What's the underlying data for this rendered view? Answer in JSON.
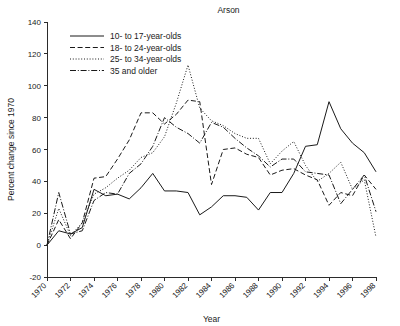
{
  "chart_data": {
    "type": "line",
    "title": "Arson",
    "xlabel": "Year",
    "ylabel": "Percent change since 1970",
    "xlim": [
      1970,
      1998
    ],
    "ylim": [
      -20,
      140
    ],
    "ytick_values": [
      -20,
      0,
      20,
      40,
      60,
      80,
      100,
      120,
      140
    ],
    "ytick_labels": [
      "-20",
      "0",
      "20",
      "40",
      "60",
      "80",
      "100",
      "120",
      "140"
    ],
    "xtick_values": [
      1970,
      1972,
      1974,
      1976,
      1978,
      1980,
      1982,
      1984,
      1986,
      1988,
      1990,
      1992,
      1994,
      1996,
      1998
    ],
    "xtick_labels": [
      "1970",
      "1972",
      "1974",
      "1976",
      "1978",
      "1980",
      "1982",
      "1984",
      "1986",
      "1988",
      "1990",
      "1992",
      "1994",
      "1996",
      "1998"
    ],
    "grid": false,
    "legend_position": "upper-left",
    "x": [
      1970,
      1971,
      1972,
      1973,
      1974,
      1975,
      1976,
      1977,
      1978,
      1979,
      1980,
      1981,
      1982,
      1983,
      1984,
      1985,
      1986,
      1987,
      1988,
      1989,
      1990,
      1991,
      1992,
      1993,
      1994,
      1995,
      1996,
      1997,
      1998
    ],
    "series": [
      {
        "name": "10- to 17-year-olds",
        "dash": "solid",
        "values": [
          0,
          9,
          7,
          11,
          35,
          31,
          32,
          29,
          36,
          45,
          34,
          34,
          33,
          19,
          24,
          31,
          31,
          30,
          22,
          33,
          33,
          45,
          62,
          63,
          90,
          73,
          64,
          58,
          46
        ]
      },
      {
        "name": "18- to 24-year-olds",
        "dash": "dashed",
        "values": [
          0,
          16,
          4,
          14,
          42,
          43,
          54,
          66,
          83,
          83,
          76,
          82,
          91,
          90,
          38,
          60,
          61,
          57,
          55,
          44,
          47,
          48,
          44,
          41,
          25,
          33,
          31,
          44,
          35
        ]
      },
      {
        "name": "25- to 34-year-olds",
        "dash": "dotted",
        "values": [
          0,
          23,
          6,
          14,
          32,
          36,
          42,
          47,
          55,
          58,
          68,
          89,
          113,
          86,
          78,
          75,
          70,
          67,
          67,
          51,
          59,
          65,
          50,
          40,
          45,
          52,
          35,
          41,
          5
        ]
      },
      {
        "name": "35 and older",
        "dash": "dashdot",
        "values": [
          0,
          33,
          7,
          9,
          28,
          33,
          32,
          45,
          51,
          62,
          80,
          74,
          70,
          64,
          77,
          74,
          67,
          61,
          56,
          49,
          54,
          54,
          46,
          45,
          44,
          26,
          35,
          44,
          21
        ]
      }
    ]
  },
  "legend": {
    "items": [
      {
        "label": "10- to 17-year-olds"
      },
      {
        "label": "18- to 24-year-olds"
      },
      {
        "label": "25- to 34-year-olds"
      },
      {
        "label": "35 and older"
      }
    ]
  },
  "colors": {
    "ink": "#1a1a1a",
    "axis": "#2b2b2b",
    "background": "#ffffff"
  }
}
